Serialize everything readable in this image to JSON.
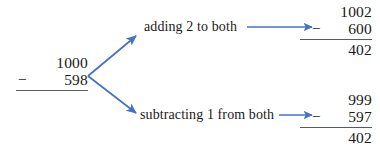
{
  "figure": {
    "accent_color": "#4372C4",
    "rule_color": "#555b62",
    "text_color": "#1a1a1a",
    "background": "#ffffff"
  },
  "source_problem": {
    "minuend": "1000",
    "operator": "−",
    "subtrahend": "598"
  },
  "branches": [
    {
      "label": "adding 2 to both",
      "result": {
        "minuend": "1002",
        "operator": "−",
        "subtrahend": "600",
        "difference": "402"
      }
    },
    {
      "label": "subtracting 1 from both",
      "result": {
        "minuend": "999",
        "operator": "−",
        "subtrahend": "597",
        "difference": "402"
      }
    }
  ],
  "arrows": {
    "upper_branch": "branch-arrow-up",
    "lower_branch": "branch-arrow-down",
    "upper_connector": "connector-arrow-top",
    "lower_connector": "connector-arrow-bottom"
  }
}
